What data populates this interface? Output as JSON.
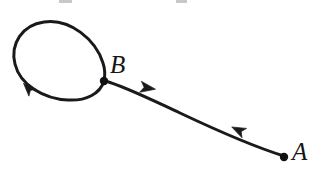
{
  "figure": {
    "kind": "phase-portrait-trajectory-diagram",
    "background_color": "#ffffff",
    "stroke_color": "#1a1a1a",
    "width": 314,
    "height": 173
  },
  "labels": {
    "point_b": "B",
    "point_a": "A"
  },
  "points": {
    "b": {
      "label": "B",
      "x": 104,
      "y": 81,
      "radius": 4.2,
      "role": "on-limit-cycle"
    },
    "a": {
      "label": "A",
      "x": 284,
      "y": 157,
      "radius": 4.2,
      "role": "trajectory-start"
    }
  },
  "curves": {
    "limit_cycle": {
      "name": "closed-orbit",
      "direction": "counterclockwise",
      "stroke_width": 3.0,
      "bbox": {
        "left": 14,
        "top": 22,
        "right": 104,
        "bottom": 100
      },
      "path": "M 104 81 C 100 94 86 101 68 100 C 44 99 20 85 15 64 C 10 44 22 25 44 22 C 70 18 96 40 103 63 C 105 69 105 76 104 81 Z"
    },
    "inflow_arc": {
      "name": "incoming-trajectory",
      "from": "A",
      "to": "B",
      "direction": "from-A-to-B",
      "stroke_width": 3.0,
      "path": "M 284 156 C 258 148 216 130 180 113 C 152 100 124 86 105 81"
    }
  },
  "arrowheads": [
    {
      "name": "arrow-on-limit-cycle",
      "x": 28,
      "y": 88,
      "angle_deg": 226,
      "size": 13
    },
    {
      "name": "arrow-near-b-outflow",
      "x": 148,
      "y": 88,
      "angle_deg": 10,
      "size": 15
    },
    {
      "name": "arrow-on-inflow-arc",
      "x": 238,
      "y": 130,
      "angle_deg": 206,
      "size": 14
    }
  ],
  "artifacts": {
    "top_left_mark": "cropped-glyph-fragment",
    "top_right_mark": "cropped-glyph-fragment"
  }
}
